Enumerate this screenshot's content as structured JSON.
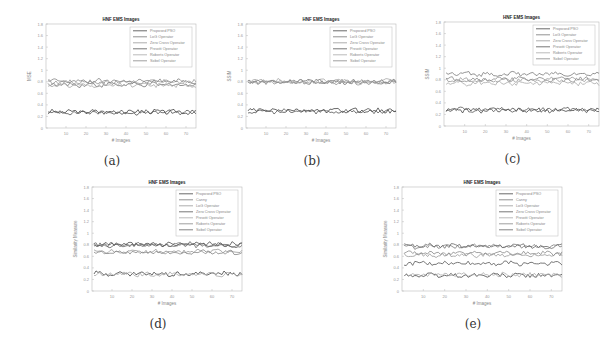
{
  "chart_data": [
    {
      "id": "a",
      "caption": "(a)",
      "type": "line",
      "title": "HNF EMS Images",
      "xlabel": "# Images",
      "ylabel": "MSE",
      "xlim": [
        0,
        75
      ],
      "ylim": [
        0,
        1.8
      ],
      "xticks": [
        10,
        20,
        30,
        40,
        50,
        60,
        70
      ],
      "yticks": [
        0,
        0.2,
        0.4,
        0.6,
        0.8,
        1,
        1.2,
        1.4,
        1.6,
        1.8
      ],
      "grid": false,
      "legend_position": "upper right",
      "legend": [
        "Proposed PSO",
        "LoG Operator",
        "Zero Cross Operator",
        "Prewitt Operator",
        "Roberts Operator",
        "Sobel Operator"
      ],
      "series": [
        {
          "name": "Proposed PSO",
          "level": 0.28
        },
        {
          "name": "LoG Operator",
          "level": 0.75
        },
        {
          "name": "Zero Cross Operator",
          "level": 0.8
        },
        {
          "name": "Prewitt Operator",
          "level": 0.27
        },
        {
          "name": "Roberts Operator",
          "level": 0.74
        },
        {
          "name": "Sobel Operator",
          "level": 0.81
        }
      ]
    },
    {
      "id": "b",
      "caption": "(b)",
      "type": "line",
      "title": "HNF EMS Images",
      "xlabel": "# Images",
      "ylabel": "SSIM",
      "xlim": [
        0,
        75
      ],
      "ylim": [
        0,
        1.8
      ],
      "xticks": [
        10,
        20,
        30,
        40,
        50,
        60,
        70
      ],
      "yticks": [
        0,
        0.2,
        0.4,
        0.6,
        0.8,
        1,
        1.2,
        1.4,
        1.6,
        1.8
      ],
      "grid": false,
      "legend_position": "upper right",
      "legend": [
        "Proposed PSO",
        "LoG Operator",
        "Zero Cross Operator",
        "Prewitt Operator",
        "Roberts Operator",
        "Sobel Operator"
      ],
      "series": [
        {
          "name": "Proposed PSO",
          "level": 0.3
        },
        {
          "name": "LoG Operator",
          "level": 0.8
        },
        {
          "name": "Zero Cross Operator",
          "level": 0.79
        },
        {
          "name": "Prewitt Operator",
          "level": 0.29
        },
        {
          "name": "Roberts Operator",
          "level": 0.81
        },
        {
          "name": "Sobel Operator",
          "level": 0.8
        }
      ]
    },
    {
      "id": "c",
      "caption": "(c)",
      "type": "line",
      "title": "HNF EMS Images",
      "xlabel": "# Images",
      "ylabel": "SSIM",
      "xlim": [
        0,
        75
      ],
      "ylim": [
        0,
        1.8
      ],
      "xticks": [
        10,
        20,
        30,
        40,
        50,
        60,
        70
      ],
      "yticks": [
        0,
        0.2,
        0.4,
        0.6,
        0.8,
        1,
        1.2,
        1.4,
        1.6,
        1.8
      ],
      "grid": false,
      "legend_position": "upper right",
      "legend": [
        "Proposed PSO",
        "LoG Operator",
        "Zero Cross Operator",
        "Prewitt Operator",
        "Roberts Operator",
        "Sobel Operator"
      ],
      "series": [
        {
          "name": "Proposed PSO",
          "level": 0.27
        },
        {
          "name": "LoG Operator",
          "level": 0.9
        },
        {
          "name": "Zero Cross Operator",
          "level": 0.8
        },
        {
          "name": "Prewitt Operator",
          "level": 0.28
        },
        {
          "name": "Roberts Operator",
          "level": 0.74
        },
        {
          "name": "Sobel Operator",
          "level": 0.81
        }
      ]
    },
    {
      "id": "d",
      "caption": "(d)",
      "type": "line",
      "title": "HNF EMS Images",
      "xlabel": "# Images",
      "ylabel": "Similarity Measure",
      "xlim": [
        0,
        75
      ],
      "ylim": [
        0,
        1.8
      ],
      "xticks": [
        10,
        20,
        30,
        40,
        50,
        60,
        70
      ],
      "yticks": [
        0,
        0.2,
        0.4,
        0.6,
        0.8,
        1,
        1.2,
        1.4,
        1.6,
        1.8
      ],
      "grid": false,
      "legend_position": "upper right",
      "legend": [
        "Proposed PSO",
        "Canny",
        "LoG Operator",
        "Zero Cross Operator",
        "Prewitt Operator",
        "Roberts Operator",
        "Sobel Operator"
      ],
      "series": [
        {
          "name": "Proposed PSO",
          "level": 0.3
        },
        {
          "name": "Canny",
          "level": 0.8
        },
        {
          "name": "LoG Operator",
          "level": 0.68
        },
        {
          "name": "Zero Cross Operator",
          "level": 0.81
        },
        {
          "name": "Prewitt Operator",
          "level": 0.29
        },
        {
          "name": "Roberts Operator",
          "level": 0.67
        },
        {
          "name": "Sobel Operator",
          "level": 0.79
        }
      ]
    },
    {
      "id": "e",
      "caption": "(e)",
      "type": "line",
      "title": "HNF EMS Images",
      "xlabel": "# Images",
      "ylabel": "Similarity Measure",
      "xlim": [
        0,
        75
      ],
      "ylim": [
        0,
        1.8
      ],
      "xticks": [
        10,
        20,
        30,
        40,
        50,
        60,
        70
      ],
      "yticks": [
        0,
        0.2,
        0.4,
        0.6,
        0.8,
        1,
        1.2,
        1.4,
        1.6,
        1.8
      ],
      "grid": false,
      "legend_position": "upper right",
      "legend": [
        "Proposed PSO",
        "Canny",
        "LoG Operator",
        "Zero Cross Operator",
        "Prewitt Operator",
        "Roberts Operator",
        "Sobel Operator"
      ],
      "series": [
        {
          "name": "Proposed PSO",
          "level": 0.27
        },
        {
          "name": "Canny",
          "level": 0.77
        },
        {
          "name": "LoG Operator",
          "level": 0.62
        },
        {
          "name": "Zero Cross Operator",
          "level": 0.48
        },
        {
          "name": "Prewitt Operator",
          "level": 0.28
        },
        {
          "name": "Roberts Operator",
          "level": 0.65
        },
        {
          "name": "Sobel Operator",
          "level": 0.78
        }
      ]
    }
  ],
  "layout": {
    "panels": [
      {
        "left": 22,
        "top": 12,
        "width": 180,
        "height": 160,
        "caption_left": 60,
        "caption_top": 150
      },
      {
        "left": 222,
        "top": 12,
        "width": 180,
        "height": 160,
        "caption_left": 262,
        "caption_top": 150
      },
      {
        "left": 420,
        "top": 10,
        "width": 185,
        "height": 160,
        "caption_left": 494,
        "caption_top": 150
      },
      {
        "left": 68,
        "top": 175,
        "width": 180,
        "height": 160,
        "caption_left": 136,
        "caption_top": 315
      },
      {
        "left": 378,
        "top": 175,
        "width": 190,
        "height": 160,
        "caption_left": 460,
        "caption_top": 315
      }
    ],
    "line_colors": [
      "#444444",
      "#777777",
      "#999999",
      "#555555",
      "#aaaaaa",
      "#888888",
      "#666666"
    ]
  }
}
